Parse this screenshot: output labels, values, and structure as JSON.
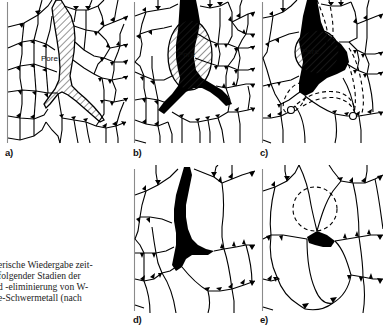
{
  "figure": {
    "kind": "micrograph-schematic",
    "ink_color": "#000000",
    "paper_color": "#ffffff",
    "rule_color": "#8a8a8a",
    "hatch_color": "#2b2b2b"
  },
  "panels": [
    {
      "id": "a",
      "label": "a)",
      "pore_label": "Pore",
      "pore_fill": "hatched",
      "has_dashed_outline": false,
      "has_black_pockets": false
    },
    {
      "id": "b",
      "label": "b)",
      "pore_label": "Pore",
      "pore_fill": "hatched",
      "has_dashed_outline": false,
      "has_black_pockets": true
    },
    {
      "id": "c",
      "label": "c)",
      "pore_label": "Pore",
      "pore_fill": "hatched",
      "has_dashed_outline": true,
      "has_black_pockets": true
    },
    {
      "id": "d",
      "label": "d)",
      "pore_label": "",
      "pore_fill": "solid-black",
      "has_dashed_outline": false,
      "has_black_pockets": true
    },
    {
      "id": "e",
      "label": "e)",
      "pore_label": "",
      "pore_fill": "solid-black",
      "has_dashed_outline": true,
      "has_black_pockets": true
    }
  ],
  "caption": {
    "lines": [
      "erische Wiedergabe zeit-",
      "folgender  Stadien  der",
      "d -eliminierung von W-",
      "e-Schwermetall    (nach"
    ]
  }
}
